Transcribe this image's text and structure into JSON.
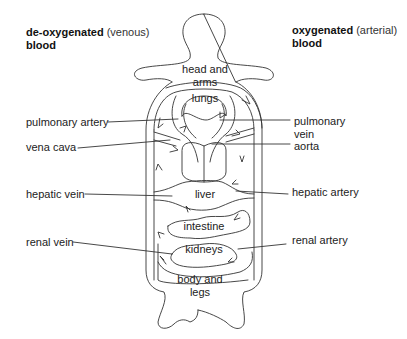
{
  "headings": {
    "left": {
      "bold": "de-oxygenated",
      "light": "(venous)",
      "line2": "blood"
    },
    "right": {
      "bold": "oxygenated",
      "light": "(arterial)",
      "line2": "blood"
    }
  },
  "organs": {
    "head": "head and arms",
    "lungs": "lungs",
    "liver": "liver",
    "intestine": "intestine",
    "kidneys": "kidneys",
    "body_line1": "body and",
    "body_line2": "legs"
  },
  "left_labels": {
    "pulmonary_artery": "pulmonary artery",
    "vena_cava": "vena cava",
    "hepatic_vein": "hepatic vein",
    "renal_vein": "renal vein"
  },
  "right_labels": {
    "pulmonary_vein_line1": "pulmonary",
    "pulmonary_vein_line2": "vein",
    "aorta": "aorta",
    "hepatic_artery": "hepatic artery",
    "renal_artery": "renal artery"
  }
}
